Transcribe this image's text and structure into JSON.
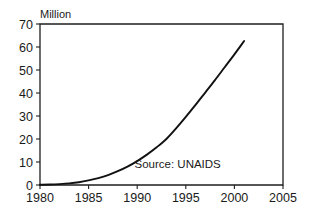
{
  "chart_data": {
    "type": "line",
    "title": "",
    "subtitle": "",
    "xlabel": "",
    "ylabel": "Million",
    "ylabel_position": "above-axis-top",
    "xlim": [
      1980,
      2005
    ],
    "ylim": [
      0,
      70
    ],
    "grid": false,
    "legend": null,
    "annotations": [
      {
        "name": "source-note",
        "text": "Source: UNAIDS",
        "x": 1998.6,
        "y": 7.5,
        "align": "right"
      }
    ],
    "x_tick_labels": [
      "1980",
      "1985",
      "1990",
      "1995",
      "2000",
      "2005"
    ],
    "x_ticks": [
      1980,
      1985,
      1990,
      1995,
      2000,
      2005
    ],
    "y_tick_labels": [
      "0",
      "10",
      "20",
      "30",
      "40",
      "50",
      "60",
      "70"
    ],
    "y_ticks": [
      0,
      10,
      20,
      30,
      40,
      50,
      60,
      70
    ],
    "series": [
      {
        "name": "People living with HIV/AIDS",
        "x": [
          1980,
          1981,
          1982,
          1983,
          1984,
          1985,
          1986,
          1987,
          1988,
          1989,
          1990,
          1991,
          1992,
          1993,
          1994,
          1995,
          1996,
          1997,
          1998,
          1999,
          2000,
          2001
        ],
        "values": [
          0.1,
          0.2,
          0.4,
          0.7,
          1.2,
          2.0,
          3.0,
          4.3,
          6.0,
          8.0,
          10.4,
          13.2,
          16.4,
          20.0,
          24.6,
          29.6,
          34.8,
          40.2,
          45.6,
          51.2,
          56.8,
          62.6
        ]
      }
    ],
    "units": "Million",
    "line_color": "#111111",
    "frame_color": "#1f1f1f",
    "background_color": "#ffffff"
  },
  "plot_geometry": {
    "left": 40,
    "right": 283,
    "top": 24,
    "bottom": 185
  }
}
